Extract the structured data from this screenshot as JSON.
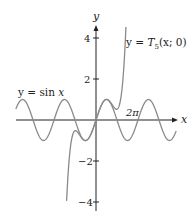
{
  "chart_data": {
    "type": "line",
    "title": "",
    "xlabel": "x",
    "ylabel": "y",
    "xlim": [
      -12,
      12
    ],
    "ylim": [
      -4.2,
      4.6
    ],
    "grid": false,
    "legend": "inline labels",
    "y_ticks": [
      {
        "value": 4,
        "label": "4"
      },
      {
        "value": 2,
        "label": "2"
      },
      {
        "value": -2,
        "label": "−2"
      },
      {
        "value": -4,
        "label": "−4"
      }
    ],
    "x_annotations": [
      {
        "value": 6.2832,
        "label": "2π"
      }
    ],
    "series": [
      {
        "name": "y = sin x",
        "function": "sin(x)",
        "domain": [
          -12,
          12
        ],
        "color": "#8a8a8a"
      },
      {
        "name": "y = T5(x; 0)",
        "function": "x - x^3/6 + x^5/120",
        "domain": [
          -4.8,
          4.8
        ],
        "color": "#8a8a8a"
      }
    ],
    "annotations": [
      {
        "text": "y = sin x",
        "near": "upper-left of sine curve"
      },
      {
        "text": "y = T5(x; 0)",
        "near": "top of Taylor polynomial curve"
      }
    ]
  },
  "labels": {
    "x_axis": "x",
    "y_axis": "y",
    "tick_4": "4",
    "tick_2": "2",
    "tick_m2": "−2",
    "tick_m4": "−4",
    "two_pi": "2π",
    "sin_label_prefix": "y = sin ",
    "sin_label_var": "x",
    "taylor_label_prefix": "y = ",
    "taylor_label_T": "T",
    "taylor_label_sub": "5",
    "taylor_label_args": "(x; 0)"
  },
  "colors": {
    "axis": "#222222",
    "curve": "#8a8a8a"
  }
}
